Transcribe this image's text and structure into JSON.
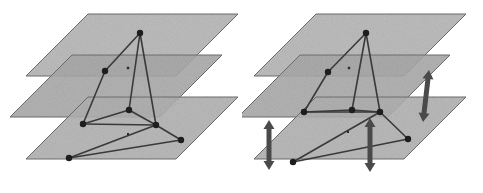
{
  "figure": {
    "title": "",
    "caption": "",
    "background": "#ffffff",
    "width": 483,
    "height": 193,
    "type": "multilayer-network-diagram",
    "panel_count": 2
  },
  "style": {
    "plane_fill_light": "#b4b4b4",
    "plane_fill_mid": "#a8a8a8",
    "plane_fill_dark": "#9c9c9c",
    "plane_stroke": "#6e6e6e",
    "plane_opacity": 0.88,
    "edge_color": "#3a3a3a",
    "edge_width": 1.6,
    "node_color": "#1e1e1e",
    "node_radius": 3.2,
    "arrow_color": "#4a4a4a",
    "arrow_width": 5
  },
  "geometry": {
    "plane_shear_x": -62,
    "plane_width": 150,
    "plane_depth": 62,
    "layer_gap_y": 42
  },
  "panels": [
    {
      "id": "panel-left",
      "name": "network-without-coupling",
      "label": "",
      "layers": [
        {
          "name": "layer-top",
          "index": 0,
          "points": "88,14 238,14 176,76 26,76",
          "fill": "#b4b4b4"
        },
        {
          "name": "layer-middle",
          "index": 1,
          "points": "72,55 222,55 160,117 10,117",
          "fill": "#a8a8a8"
        },
        {
          "name": "layer-bottom",
          "index": 2,
          "points": "88,97 238,97 176,159 26,159",
          "fill": "#b0b0b0"
        }
      ],
      "nodes": [
        {
          "name": "node-a",
          "layer": 0,
          "x": 140,
          "y": 33
        },
        {
          "name": "node-b",
          "layer": 1,
          "x": 105,
          "y": 71
        },
        {
          "name": "node-c",
          "layer": 1,
          "x": 129,
          "y": 110
        },
        {
          "name": "node-d",
          "layer": 1,
          "x": 83,
          "y": 124
        },
        {
          "name": "node-e",
          "layer": 1,
          "x": 156,
          "y": 125
        },
        {
          "name": "node-f",
          "layer": 2,
          "x": 181,
          "y": 140
        },
        {
          "name": "node-g",
          "layer": 2,
          "x": 69,
          "y": 158
        }
      ],
      "marks": [
        {
          "name": "small-mark-upper",
          "x": 128,
          "y": 68,
          "size": 2.4
        },
        {
          "name": "small-mark-lower",
          "x": 128,
          "y": 134,
          "size": 2.0
        }
      ],
      "edges": [
        {
          "name": "edge-a-b",
          "from": "node-a",
          "to": "node-b"
        },
        {
          "name": "edge-a-c",
          "from": "node-a",
          "to": "node-c"
        },
        {
          "name": "edge-a-e",
          "from": "node-a",
          "to": "node-e"
        },
        {
          "name": "edge-b-d",
          "from": "node-b",
          "to": "node-d"
        },
        {
          "name": "edge-c-d",
          "from": "node-c",
          "to": "node-d"
        },
        {
          "name": "edge-d-e",
          "from": "node-d",
          "to": "node-e"
        },
        {
          "name": "edge-c-e",
          "from": "node-c",
          "to": "node-e"
        },
        {
          "name": "edge-e-f",
          "from": "node-e",
          "to": "node-f"
        },
        {
          "name": "edge-f-g",
          "from": "node-f",
          "to": "node-g"
        },
        {
          "name": "edge-g-e",
          "from": "node-g",
          "to": "node-e"
        }
      ],
      "arrows": []
    },
    {
      "id": "panel-right",
      "name": "network-with-interlayer-coupling",
      "label": "",
      "layers": [
        {
          "name": "layer-top",
          "index": 0,
          "points": "74,14 224,14 162,76 12,76",
          "fill": "#b4b4b4"
        },
        {
          "name": "layer-middle",
          "index": 1,
          "points": "58,55 208,55 146,117 -4,117",
          "fill": "#a8a8a8"
        },
        {
          "name": "layer-bottom",
          "index": 2,
          "points": "74,97 224,97 162,159 12,159",
          "fill": "#b0b0b0"
        }
      ],
      "nodes": [
        {
          "name": "node-a",
          "layer": 0,
          "x": 124,
          "y": 33
        },
        {
          "name": "node-b",
          "layer": 1,
          "x": 86,
          "y": 72
        },
        {
          "name": "node-c",
          "layer": 1,
          "x": 110,
          "y": 110
        },
        {
          "name": "node-d",
          "layer": 1,
          "x": 62,
          "y": 112
        },
        {
          "name": "node-e",
          "layer": 1,
          "x": 138,
          "y": 112
        },
        {
          "name": "node-f",
          "layer": 2,
          "x": 166,
          "y": 139
        },
        {
          "name": "node-g",
          "layer": 2,
          "x": 51,
          "y": 162
        }
      ],
      "marks": [
        {
          "name": "small-mark-upper",
          "x": 107,
          "y": 68,
          "size": 2.4
        },
        {
          "name": "small-mark-lower",
          "x": 106,
          "y": 132,
          "size": 2.0
        }
      ],
      "edges": [
        {
          "name": "edge-a-b",
          "from": "node-a",
          "to": "node-b"
        },
        {
          "name": "edge-a-c",
          "from": "node-a",
          "to": "node-c"
        },
        {
          "name": "edge-a-e",
          "from": "node-a",
          "to": "node-e"
        },
        {
          "name": "edge-b-d",
          "from": "node-b",
          "to": "node-d"
        },
        {
          "name": "edge-c-d",
          "from": "node-c",
          "to": "node-d"
        },
        {
          "name": "edge-d-e",
          "from": "node-d",
          "to": "node-e"
        },
        {
          "name": "edge-c-e",
          "from": "node-c",
          "to": "node-e"
        },
        {
          "name": "edge-e-f",
          "from": "node-e",
          "to": "node-f"
        },
        {
          "name": "edge-f-g",
          "from": "node-f",
          "to": "node-g"
        },
        {
          "name": "edge-g-e",
          "from": "node-g",
          "to": "node-e"
        }
      ],
      "arrows": [
        {
          "name": "interlayer-arrow-left",
          "x1": 27,
          "y1": 120,
          "x2": 27,
          "y2": 170
        },
        {
          "name": "interlayer-arrow-middle",
          "x1": 128,
          "y1": 118,
          "x2": 128,
          "y2": 172
        },
        {
          "name": "interlayer-arrow-right",
          "x1": 187,
          "y1": 70,
          "x2": 181,
          "y2": 122
        }
      ]
    }
  ]
}
